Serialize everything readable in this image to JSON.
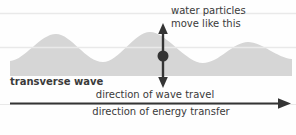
{
  "diagram": {
    "type": "physics-wave-diagram",
    "title": "transverse wave",
    "labels": {
      "particle_motion_line1": "water particles",
      "particle_motion_line2": "move like this",
      "wave_name": "transverse wave",
      "wave_travel": "direction of wave travel",
      "energy_transfer": "direction of energy transfer"
    },
    "icons": {
      "oscillation_arrow": "vertical double-headed arrow",
      "particle_dot": "filled circle marking a water particle",
      "travel_arrow": "long right-pointing arrow"
    },
    "colors": {
      "background": "#fefefe",
      "wave_fill": "#d6d6d6",
      "ruled_line": "#e9e9e9",
      "ink": "#343434",
      "text": "#3a3a3a"
    }
  }
}
